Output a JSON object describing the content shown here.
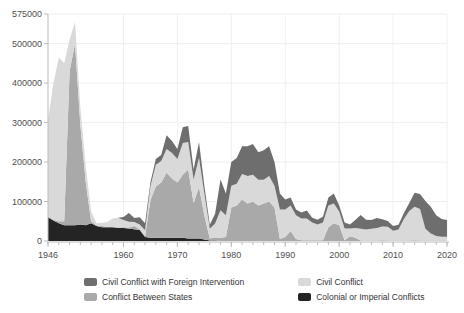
{
  "chart_data": {
    "type": "area",
    "stacked": true,
    "title": "",
    "xlabel": "",
    "ylabel": "",
    "xlim": [
      1946,
      2020
    ],
    "ylim": [
      0,
      575000
    ],
    "x_step_years": 1,
    "x_ticks": [
      1946,
      1960,
      1970,
      1980,
      1990,
      2000,
      2010,
      2020
    ],
    "x_minor_tick_step": 2,
    "y_ticks": [
      0,
      100000,
      200000,
      300000,
      400000,
      500000,
      575000
    ],
    "grid": true,
    "legend_position": "bottom",
    "colors": {
      "grid": "#efefef",
      "axis": "#bcbcbc",
      "tick_text": "#4f4f4f"
    },
    "series": [
      {
        "key": "colonial",
        "name": "Colonial or Imperial Conflicts",
        "color": "#242424",
        "values": [
          60000,
          52000,
          45000,
          40000,
          40000,
          40000,
          42000,
          40000,
          45000,
          38000,
          35000,
          35000,
          35000,
          33000,
          33000,
          32000,
          30000,
          28000,
          10000,
          8000,
          8000,
          8000,
          8000,
          8000,
          8000,
          8000,
          6000,
          6000,
          6000,
          4000,
          1000,
          1000,
          0,
          0,
          0,
          0,
          0,
          0,
          0,
          0,
          0,
          0,
          0,
          0,
          0,
          0,
          0,
          0,
          0,
          0,
          0,
          0,
          0,
          0,
          0,
          0,
          0,
          0,
          0,
          0,
          0,
          0,
          0,
          0,
          0,
          0,
          0,
          0,
          0,
          0,
          0,
          0,
          0,
          0,
          0
        ]
      },
      {
        "key": "interstate",
        "name": "Conflict Between States",
        "color": "#a9a9a9",
        "values": [
          2000,
          2000,
          5000,
          10000,
          390000,
          460000,
          250000,
          110000,
          5000,
          1000,
          3000,
          1000,
          2000,
          1000,
          2000,
          2000,
          8000,
          2000,
          2000,
          95000,
          130000,
          140000,
          165000,
          150000,
          140000,
          160000,
          175000,
          90000,
          130000,
          60000,
          5000,
          8000,
          8000,
          10000,
          85000,
          90000,
          105000,
          95000,
          100000,
          90000,
          95000,
          100000,
          85000,
          5000,
          10000,
          25000,
          5000,
          2000,
          2000,
          2000,
          2000,
          2000,
          35000,
          45000,
          40000,
          2000,
          12000,
          8000,
          1000,
          1000,
          1000,
          1000,
          2000,
          1000,
          1000,
          1000,
          1000,
          1000,
          2000,
          1000,
          1000,
          1000,
          1000,
          1000,
          1000
        ]
      },
      {
        "key": "civil",
        "name": "Civil Conflict",
        "color": "#d9d9d9",
        "values": [
          245000,
          345000,
          415000,
          400000,
          80000,
          55000,
          45000,
          40000,
          25000,
          6000,
          8000,
          12000,
          20000,
          25000,
          18000,
          15000,
          10000,
          12000,
          15000,
          35000,
          55000,
          55000,
          60000,
          65000,
          60000,
          80000,
          70000,
          60000,
          75000,
          55000,
          25000,
          35000,
          70000,
          55000,
          55000,
          55000,
          65000,
          70000,
          68000,
          65000,
          60000,
          65000,
          55000,
          75000,
          70000,
          65000,
          60000,
          55000,
          55000,
          45000,
          40000,
          45000,
          55000,
          50000,
          35000,
          30000,
          20000,
          25000,
          30000,
          28000,
          30000,
          32000,
          35000,
          35000,
          25000,
          28000,
          55000,
          75000,
          85000,
          80000,
          30000,
          18000,
          12000,
          10000,
          10000
        ]
      },
      {
        "key": "civil_fi",
        "name": "Civil Conflict with Foreign Intervention",
        "color": "#6e6e6e",
        "values": [
          0,
          0,
          0,
          0,
          0,
          0,
          0,
          0,
          0,
          0,
          0,
          0,
          0,
          0,
          8000,
          22000,
          10000,
          18000,
          18000,
          10000,
          15000,
          15000,
          35000,
          30000,
          25000,
          40000,
          40000,
          25000,
          40000,
          20000,
          10000,
          25000,
          78000,
          55000,
          60000,
          65000,
          70000,
          75000,
          78000,
          70000,
          75000,
          75000,
          60000,
          40000,
          25000,
          20000,
          15000,
          15000,
          20000,
          12000,
          12000,
          15000,
          20000,
          25000,
          15000,
          15000,
          10000,
          20000,
          35000,
          25000,
          22000,
          25000,
          18000,
          15000,
          12000,
          12000,
          15000,
          20000,
          35000,
          38000,
          70000,
          68000,
          52000,
          45000,
          42000
        ]
      }
    ],
    "legend_order": [
      "civil_fi",
      "civil",
      "interstate",
      "colonial"
    ]
  }
}
